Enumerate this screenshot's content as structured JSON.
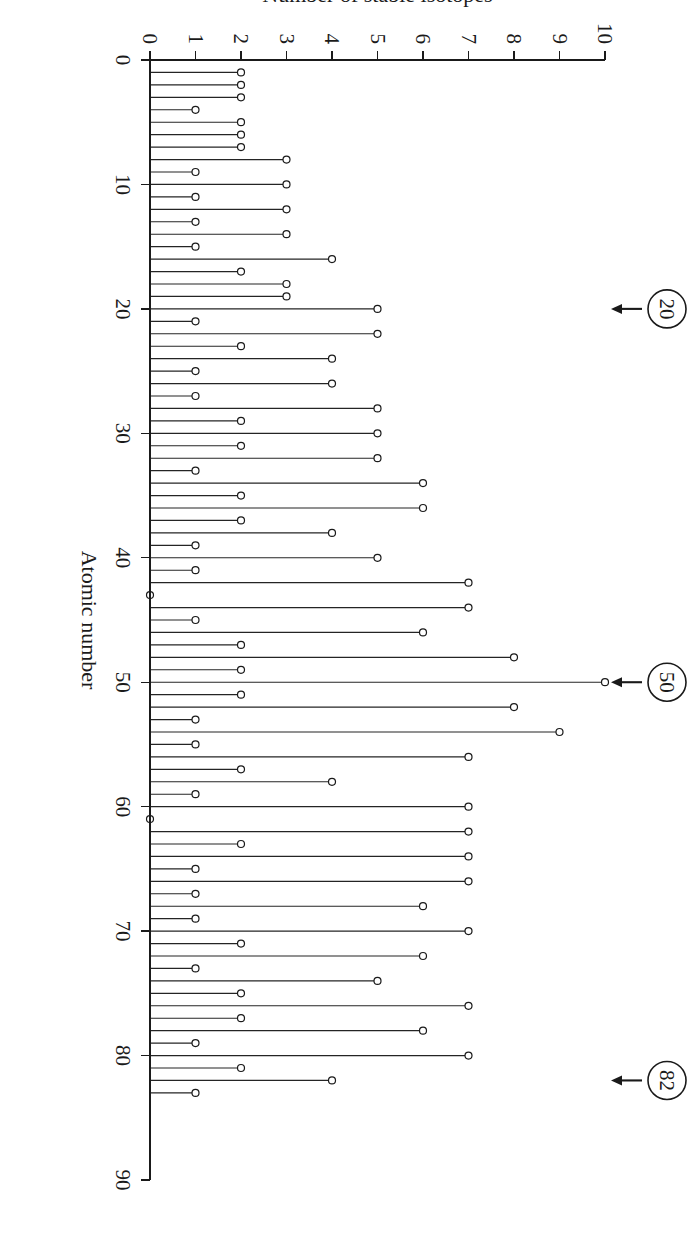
{
  "figure": {
    "background_color": "#ffffff",
    "ink_color": "#1a1a1a",
    "rotation_note": "90"
  },
  "chart_data": {
    "type": "bar",
    "title": "",
    "subtitle": "",
    "xlabel": "Atomic number",
    "ylabel": "Number of stable isotopes",
    "xlim": [
      0,
      90
    ],
    "ylim": [
      0,
      10
    ],
    "xticks": [
      0,
      10,
      20,
      30,
      40,
      50,
      60,
      70,
      80,
      90
    ],
    "xticklabels": [
      "0",
      "10",
      "20",
      "30",
      "40",
      "50",
      "60",
      "70",
      "80",
      "90"
    ],
    "yticks": [
      0,
      1,
      2,
      3,
      4,
      5,
      6,
      7,
      8,
      9,
      10
    ],
    "yticklabels": [
      "0",
      "1",
      "2",
      "3",
      "4",
      "5",
      "6",
      "7",
      "8",
      "9",
      "10"
    ],
    "grid": false,
    "legend": null,
    "marker": "open-circle",
    "x": [
      1,
      2,
      3,
      4,
      5,
      6,
      7,
      8,
      9,
      10,
      11,
      12,
      13,
      14,
      15,
      16,
      17,
      18,
      19,
      20,
      21,
      22,
      23,
      24,
      25,
      26,
      27,
      28,
      29,
      30,
      31,
      32,
      33,
      34,
      35,
      36,
      37,
      38,
      39,
      40,
      41,
      42,
      43,
      44,
      45,
      46,
      47,
      48,
      49,
      50,
      51,
      52,
      53,
      54,
      55,
      56,
      57,
      58,
      59,
      60,
      61,
      62,
      63,
      64,
      65,
      66,
      67,
      68,
      69,
      70,
      71,
      72,
      73,
      74,
      75,
      76,
      77,
      78,
      79,
      80,
      81,
      82,
      83
    ],
    "values": [
      2,
      2,
      2,
      1,
      2,
      2,
      2,
      3,
      1,
      3,
      1,
      3,
      1,
      3,
      1,
      4,
      2,
      3,
      3,
      5,
      1,
      5,
      2,
      4,
      1,
      4,
      1,
      5,
      2,
      5,
      2,
      5,
      1,
      6,
      2,
      6,
      2,
      4,
      1,
      5,
      1,
      7,
      0,
      7,
      1,
      6,
      2,
      8,
      2,
      10,
      2,
      8,
      1,
      9,
      1,
      7,
      2,
      4,
      1,
      7,
      0,
      7,
      2,
      7,
      1,
      7,
      1,
      6,
      1,
      7,
      2,
      6,
      1,
      5,
      2,
      7,
      2,
      6,
      1,
      7,
      2,
      4,
      1
    ],
    "series": [
      {
        "name": "Number of stable isotopes",
        "values": [
          2,
          2,
          2,
          1,
          2,
          2,
          2,
          3,
          1,
          3,
          1,
          3,
          1,
          3,
          1,
          4,
          2,
          3,
          3,
          5,
          1,
          5,
          2,
          4,
          1,
          4,
          1,
          5,
          2,
          5,
          2,
          5,
          1,
          6,
          2,
          6,
          2,
          4,
          1,
          5,
          1,
          7,
          0,
          7,
          1,
          6,
          2,
          8,
          2,
          10,
          2,
          8,
          1,
          9,
          1,
          7,
          2,
          4,
          1,
          7,
          0,
          7,
          2,
          7,
          1,
          7,
          1,
          6,
          1,
          7,
          2,
          6,
          1,
          5,
          2,
          7,
          2,
          6,
          1,
          7,
          2,
          4,
          1
        ]
      }
    ],
    "annotations": [
      {
        "label": "20",
        "x": 20,
        "style": "circled-with-arrow"
      },
      {
        "label": "50",
        "x": 50,
        "style": "circled-with-arrow"
      },
      {
        "label": "82",
        "x": 82,
        "style": "circled-with-arrow"
      }
    ]
  }
}
